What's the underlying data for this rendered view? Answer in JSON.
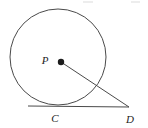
{
  "figure": {
    "type": "geometry-diagram",
    "background_color": "#ffffff",
    "stroke_color": "#4a4a4a",
    "label_color": "#232323",
    "width": 148,
    "height": 128
  },
  "labels": {
    "center_label": "P",
    "tangent_point_label": "C",
    "external_point_label": "D"
  },
  "geometry": {
    "circle": {
      "name": "circle-P",
      "center_x": 58,
      "center_y": 57,
      "radius": 48
    },
    "center_point": {
      "name": "point-P",
      "x": 61,
      "y": 62,
      "dot_radius": 3.2
    },
    "tangent_point_C": {
      "name": "point-C",
      "x": 59,
      "y": 106
    },
    "external_point_D": {
      "name": "point-D",
      "x": 129,
      "y": 107
    },
    "tangent_line": {
      "name": "segment-CD",
      "x1": 28,
      "y1": 106,
      "x2": 129,
      "y2": 107
    },
    "radius_segment": {
      "name": "segment-PD",
      "x1": 61,
      "y1": 62,
      "x2": 129,
      "y2": 107
    }
  },
  "label_positions": {
    "P": {
      "x": 45,
      "y": 64
    },
    "C": {
      "x": 55,
      "y": 122
    },
    "D": {
      "x": 130,
      "y": 123
    }
  },
  "artifacts": {
    "top_marks": [
      {
        "left": 83,
        "width": 10
      },
      {
        "left": 131,
        "width": 9
      }
    ]
  }
}
